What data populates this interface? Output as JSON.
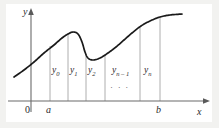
{
  "figure": {
    "type": "math-diagram",
    "background_color": "#f2f2f0",
    "plot_background_color": "#ffffff",
    "curve_color": "#1a1a1a",
    "axis_color": "#6b6b6b",
    "gridline_color": "#9a9a9a"
  },
  "axes": {
    "y_label": "y",
    "x_label": "x",
    "origin_label": "0",
    "left_bound_label": "a",
    "right_bound_label": "b"
  },
  "ordinates": [
    {
      "label": "y",
      "sub": "0",
      "x": 50
    },
    {
      "label": "y",
      "sub": "1",
      "x": 68
    },
    {
      "label": "y",
      "sub": "2",
      "x": 86
    },
    {
      "label": "y",
      "sub": "n – 1",
      "x": 140
    },
    {
      "label": "y",
      "sub": "n",
      "x": 160
    }
  ],
  "ellipsis": "· · ·",
  "chart_data": {
    "type": "line",
    "title": "",
    "xlabel": "x",
    "ylabel": "y",
    "grid": false,
    "legend": "none",
    "xlim": [
      0,
      219
    ],
    "ylim": [
      0,
      128
    ],
    "gridline_x_positions": [
      50,
      68,
      86,
      105,
      140,
      160
    ],
    "interval": {
      "a": 50,
      "b": 160
    },
    "series": [
      {
        "name": "curve",
        "points": [
          [
            14,
            77
          ],
          [
            24,
            70
          ],
          [
            34,
            62
          ],
          [
            44,
            53
          ],
          [
            54,
            45
          ],
          [
            62,
            38
          ],
          [
            68,
            34
          ],
          [
            73,
            32
          ],
          [
            78,
            34
          ],
          [
            82,
            42
          ],
          [
            85,
            52
          ],
          [
            88,
            58
          ],
          [
            93,
            60
          ],
          [
            100,
            58
          ],
          [
            108,
            53
          ],
          [
            116,
            47
          ],
          [
            124,
            40
          ],
          [
            132,
            33
          ],
          [
            141,
            26
          ],
          [
            150,
            21
          ],
          [
            160,
            17
          ],
          [
            170,
            15
          ],
          [
            182,
            14
          ]
        ]
      }
    ]
  }
}
